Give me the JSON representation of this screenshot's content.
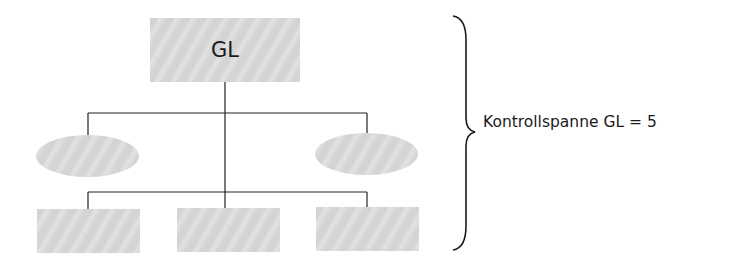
{
  "diagram": {
    "type": "org-chart",
    "top_node": {
      "label": "GL"
    },
    "staff_nodes": [
      {
        "shape": "ellipse",
        "label": ""
      },
      {
        "shape": "ellipse",
        "label": ""
      }
    ],
    "line_nodes": [
      {
        "shape": "rect",
        "label": ""
      },
      {
        "shape": "rect",
        "label": ""
      },
      {
        "shape": "rect",
        "label": ""
      }
    ],
    "annotation": {
      "text": "Kontrollspanne GL = 5"
    },
    "colors": {
      "node_fill": "#d8d8d8",
      "line": "#222222"
    }
  }
}
